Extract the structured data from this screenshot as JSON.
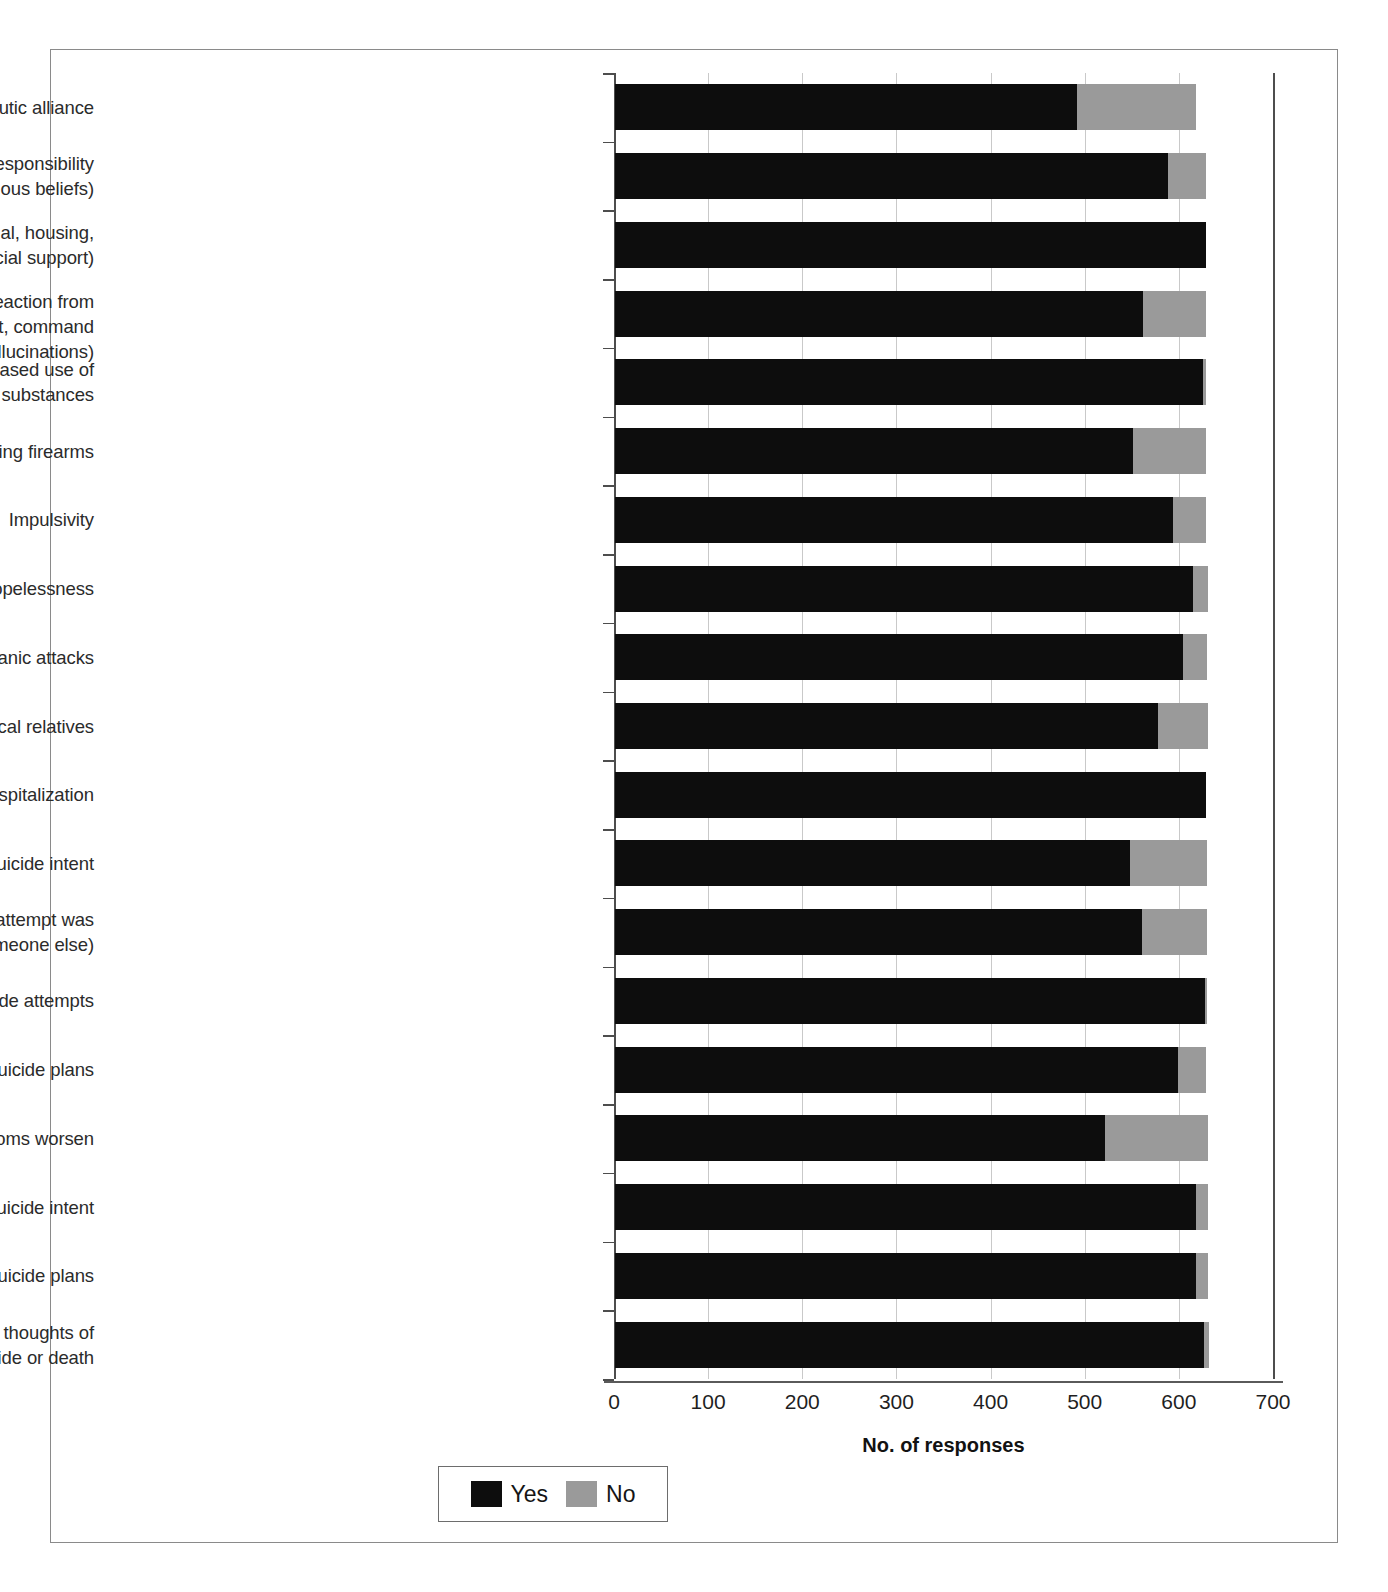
{
  "chart_data": {
    "type": "bar",
    "orientation": "horizontal",
    "stacked": true,
    "title": "",
    "xlabel": "No. of responses",
    "ylabel": "",
    "xlim": [
      0,
      700
    ],
    "xticks": [
      0,
      100,
      200,
      300,
      400,
      500,
      600,
      700
    ],
    "xtick_labels": [
      "0",
      "100",
      "200",
      "300",
      "400",
      "500",
      "600",
      "700"
    ],
    "grid": true,
    "legend": {
      "position": "bottom-left",
      "entries": [
        {
          "label": "Yes",
          "color": "#0d0d0d"
        },
        {
          "label": "No",
          "color": "#9a9a9a"
        }
      ]
    },
    "series": [
      {
        "name": "Yes",
        "color": "#0d0d0d"
      },
      {
        "name": "No",
        "color": "#9a9a9a"
      }
    ],
    "categories": [
      "Quality and strength of the therapeutic alliance",
      "Presence or absence of reasons for living (e.g., sense of responsibility to children or others, religious beliefs)",
      "Presence or absence of psychosocial stressors (e.g., financial, housing, legal or school/occupational problems; lack of social support)",
      "Presence of possible motivations for suicide (e.g., attention or reaction from others, revenge, shame, humiliation, delusional guilt, command hallucinations)",
      "Current or recent dependence, abuse, or increased use of alcohol or other substances",
      "Accessibility of suicide methods, including firearms",
      "Impulsivity",
      "Hopelessness",
      "Anxiety symptoms, including panic attacks",
      "History of suicidal behaviors in biological relatives",
      "History of psychiatric hospitalization",
      "Prior intentional self-injury without suicide intent",
      "Prior aborted or interrupted suicide attempts (in which an attempt was stopped by the individual or by someone else)",
      "Prior suicide attempts",
      "Prior suicidal ideas or suicide plans",
      "Intended course of action if current symptoms worsen",
      "Current suicide intent",
      "Current suicide plans",
      "Current suicidal ideas, including active or passive thoughts of suicide or death"
    ],
    "category_lines": [
      [
        "Quality and strength of the therapeutic alliance"
      ],
      [
        "Presence or absence of reasons for living (e.g., sense of responsibility",
        "to children or others, religious beliefs)"
      ],
      [
        "Presence or absence of psychosocial stressors (e.g., financial, housing,",
        "legal or school/occupational problems; lack of social support)"
      ],
      [
        "Presence of possible motivations for suicide (e.g., attention or reaction from",
        "others, revenge, shame, humiliation, delusional guilt, command hallucinations)"
      ],
      [
        "Current or recent dependence, abuse, or increased use of",
        "alcohol or other substances"
      ],
      [
        "Accessibility of suicide methods, including firearms"
      ],
      [
        "Impulsivity"
      ],
      [
        "Hopelessness"
      ],
      [
        "Anxiety symptoms, including panic attacks"
      ],
      [
        "History of suicidal behaviors in biological relatives"
      ],
      [
        "History of psychiatric hospitalization"
      ],
      [
        "Prior intentional self-injury without suicide intent"
      ],
      [
        "Prior aborted or interrupted suicide attempts (in which an attempt was",
        "stopped by the individual or by someone else)"
      ],
      [
        "Prior suicide attempts"
      ],
      [
        "Prior suicidal ideas or suicide plans"
      ],
      [
        "Intended course of action if current symptoms worsen"
      ],
      [
        "Current suicide intent"
      ],
      [
        "Current suicide plans"
      ],
      [
        "Current suicidal ideas, including active or passive thoughts of",
        "suicide or death"
      ]
    ],
    "values_yes": [
      491,
      587,
      628,
      561,
      625,
      550,
      593,
      614,
      603,
      577,
      628,
      547,
      560,
      627,
      598,
      520,
      617,
      617,
      626
    ],
    "values_no": [
      126,
      41,
      0,
      67,
      3,
      78,
      35,
      16,
      26,
      53,
      0,
      82,
      69,
      2,
      30,
      110,
      13,
      13,
      5
    ],
    "totals": [
      617,
      628,
      628,
      628,
      628,
      628,
      628,
      630,
      629,
      630,
      628,
      629,
      629,
      629,
      628,
      630,
      630,
      630,
      631
    ]
  }
}
